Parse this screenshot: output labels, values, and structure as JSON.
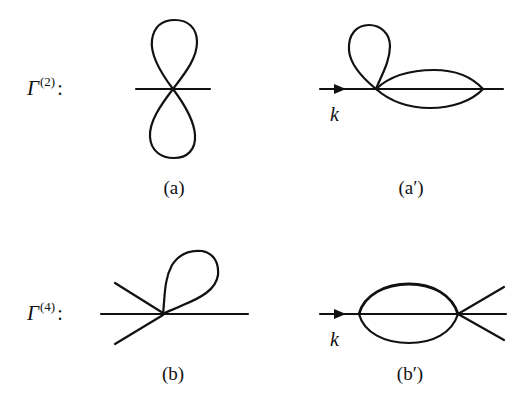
{
  "figure": {
    "rows": [
      {
        "label": {
          "symbol": "Γ",
          "superscript": "(2)",
          "suffix": ":"
        },
        "diagrams": [
          {
            "id": "a",
            "caption": "(a)",
            "description": "figure-eight tadpole: two loops on a single four-point vertex with one straight line"
          },
          {
            "id": "a-prime",
            "caption": "(a′)",
            "description": "tadpole loop plus sunset lens on a straight line with incoming momentum arrow",
            "momentum_label": "k"
          }
        ]
      },
      {
        "label": {
          "symbol": "Γ",
          "superscript": "(4)",
          "suffix": ":"
        },
        "diagrams": [
          {
            "id": "b",
            "caption": "(b)",
            "description": "six-point vertex with one tadpole loop, two legs to the left and one straight line"
          },
          {
            "id": "b-prime",
            "caption": "(b′)",
            "description": "sunset lens between two vertices with two extra outgoing legs on the right",
            "momentum_label": "k"
          }
        ]
      }
    ],
    "colors": {
      "stroke": "#111111",
      "background": "#ffffff"
    }
  }
}
